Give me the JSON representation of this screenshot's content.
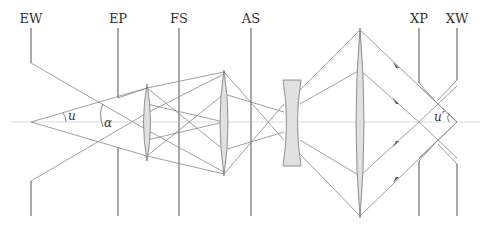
{
  "diagram": {
    "type": "optical-system-ray-diagram",
    "planes": [
      {
        "id": "EW",
        "label": "EW",
        "x": 31
      },
      {
        "id": "EP",
        "label": "EP",
        "x": 118
      },
      {
        "id": "FS",
        "label": "FS",
        "x": 179
      },
      {
        "id": "AS",
        "label": "AS",
        "x": 251
      },
      {
        "id": "XP",
        "label": "XP",
        "x": 419
      },
      {
        "id": "XW",
        "label": "XW",
        "x": 457
      }
    ],
    "angles": {
      "u": "u",
      "alpha": "α",
      "u_prime": "u′"
    },
    "lenses": [
      {
        "type": "convex",
        "x": 147,
        "top": 84,
        "bottom": 161
      },
      {
        "type": "convex",
        "x": 224,
        "top": 70,
        "bottom": 176
      },
      {
        "type": "concave",
        "x1": 283,
        "x2": 301,
        "top": 80,
        "bottom": 166
      },
      {
        "type": "convex",
        "x": 360,
        "top": 28,
        "bottom": 218
      }
    ],
    "colors": {
      "plane": "#a8a8a8",
      "ray": "#888888",
      "lens_fill": "#e0e0e0"
    }
  }
}
